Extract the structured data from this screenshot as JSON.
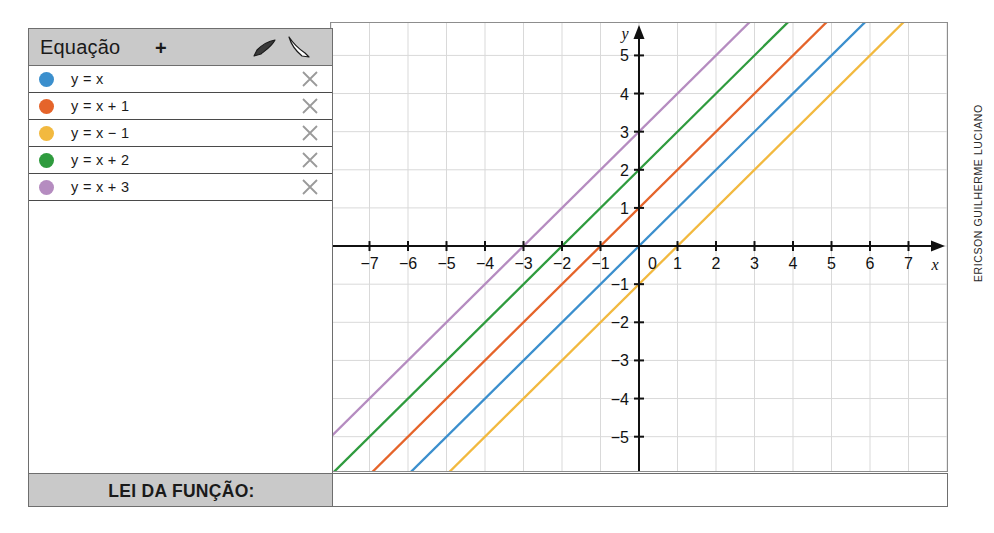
{
  "panel": {
    "title": "Equação",
    "add_label": "+",
    "cursor_dark_icon": "cursor-arrow-dark-icon",
    "cursor_light_icon": "cursor-arrow-light-icon",
    "close_icon": "close-x-icon",
    "equations": [
      {
        "label": "y = x",
        "color": "#3b8fcd"
      },
      {
        "label": "y = x + 1",
        "color": "#e5642a"
      },
      {
        "label": "y = x − 1",
        "color": "#f2b93f"
      },
      {
        "label": "y = x + 2",
        "color": "#2f9b3e"
      },
      {
        "label": "y = x + 3",
        "color": "#b58cc0"
      }
    ]
  },
  "footer": {
    "label": "LEI DA FUNÇÃO:",
    "value": ""
  },
  "credit": {
    "text": "ERICSON GUILHERME LUCIANO"
  },
  "chart_data": {
    "type": "line",
    "title": "",
    "xlabel": "x",
    "ylabel": "y",
    "xlim": [
      -8.0,
      8.0
    ],
    "ylim": [
      -5.9,
      5.85
    ],
    "x_ticks": [
      -7,
      -6,
      -5,
      -4,
      -3,
      -2,
      -1,
      0,
      1,
      2,
      3,
      4,
      5,
      6,
      7
    ],
    "y_ticks": [
      -5,
      -4,
      -3,
      -2,
      -1,
      1,
      2,
      3,
      4,
      5
    ],
    "x_tick_labels": [
      "−7",
      "−6",
      "−5",
      "−4",
      "−3",
      "−2",
      "−1",
      "0",
      "1",
      "2",
      "3",
      "4",
      "5",
      "6",
      "7"
    ],
    "y_tick_labels": [
      "−5",
      "−4",
      "−3",
      "−2",
      "−1",
      "1",
      "2",
      "3",
      "4",
      "5"
    ],
    "origin_label": "0",
    "grid": true,
    "grid_step": 1,
    "legend_position": "external-left-panel",
    "series": [
      {
        "name": "y = x",
        "color": "#3b8fcd",
        "slope": 1,
        "intercept": 0
      },
      {
        "name": "y = x + 1",
        "color": "#e5642a",
        "slope": 1,
        "intercept": 1
      },
      {
        "name": "y = x − 1",
        "color": "#f2b93f",
        "slope": 1,
        "intercept": -1
      },
      {
        "name": "y = x + 2",
        "color": "#2f9b3e",
        "slope": 1,
        "intercept": 2
      },
      {
        "name": "y = x + 3",
        "color": "#b58cc0",
        "slope": 1,
        "intercept": 3
      }
    ]
  }
}
